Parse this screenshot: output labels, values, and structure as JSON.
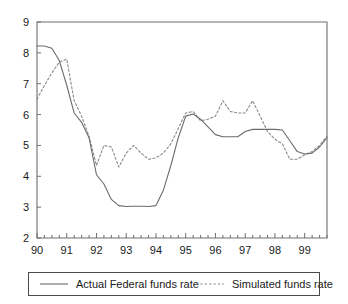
{
  "chart_data": {
    "type": "line",
    "title": "",
    "subtitle": "",
    "xlabel": "",
    "ylabel": "",
    "xlim": [
      1990.0,
      1999.75
    ],
    "ylim": [
      2,
      9
    ],
    "yticks": [
      2,
      3,
      4,
      5,
      6,
      7,
      8,
      9
    ],
    "ytick_labels": [
      "2",
      "3",
      "4",
      "5",
      "6",
      "7",
      "8",
      "9"
    ],
    "xticks": [
      1990,
      1991,
      1992,
      1993,
      1994,
      1995,
      1996,
      1997,
      1998,
      1999
    ],
    "xtick_labels": [
      "90",
      "91",
      "92",
      "93",
      "94",
      "95",
      "96",
      "97",
      "98",
      "99"
    ],
    "minor_xticks_per_year": 4,
    "grid": false,
    "legend_position": "below-plot",
    "x": [
      1990.0,
      1990.25,
      1990.5,
      1990.75,
      1991.0,
      1991.25,
      1991.5,
      1991.75,
      1992.0,
      1992.25,
      1992.5,
      1992.75,
      1993.0,
      1993.25,
      1993.5,
      1993.75,
      1994.0,
      1994.25,
      1994.5,
      1994.75,
      1995.0,
      1995.25,
      1995.5,
      1995.75,
      1996.0,
      1996.25,
      1996.5,
      1996.75,
      1997.0,
      1997.25,
      1997.5,
      1997.75,
      1998.0,
      1998.25,
      1998.5,
      1998.75,
      1999.0,
      1999.25,
      1999.5,
      1999.75
    ],
    "series": [
      {
        "name": "Actual Federal funds rate",
        "style": "solid",
        "color": "#6b6b6b",
        "values": [
          8.22,
          8.22,
          8.15,
          7.75,
          6.95,
          6.05,
          5.75,
          5.25,
          4.05,
          3.75,
          3.25,
          3.05,
          3.02,
          3.03,
          3.03,
          3.02,
          3.05,
          3.55,
          4.35,
          5.25,
          5.95,
          6.02,
          5.85,
          5.6,
          5.35,
          5.28,
          5.28,
          5.28,
          5.45,
          5.52,
          5.52,
          5.52,
          5.52,
          5.5,
          5.15,
          4.8,
          4.72,
          4.75,
          4.95,
          5.25
        ]
      },
      {
        "name": "Simulated funds rate",
        "style": "dotted",
        "color": "#8a8a8a",
        "values": [
          6.5,
          6.95,
          7.35,
          7.7,
          7.8,
          6.45,
          5.95,
          5.3,
          4.35,
          5.0,
          4.95,
          4.3,
          4.75,
          5.0,
          4.75,
          4.55,
          4.6,
          4.75,
          5.05,
          5.55,
          6.05,
          6.1,
          5.8,
          5.85,
          5.95,
          6.45,
          6.1,
          6.05,
          6.05,
          6.45,
          5.95,
          5.45,
          5.2,
          5.05,
          4.55,
          4.55,
          4.7,
          4.8,
          5.0,
          5.3
        ]
      }
    ],
    "legend": [
      {
        "label": "Actual Federal funds rate",
        "style": "solid",
        "color": "#6b6b6b"
      },
      {
        "label": "Simulated funds rate",
        "style": "dotted",
        "color": "#8a8a8a"
      }
    ],
    "colors": {
      "actual": "#6b6b6b",
      "simulated": "#8a8a8a",
      "axis": "#6e6e6e",
      "text": "#1a1a1a",
      "background": "#ffffff",
      "legend_border": "#4a4a4a"
    }
  }
}
